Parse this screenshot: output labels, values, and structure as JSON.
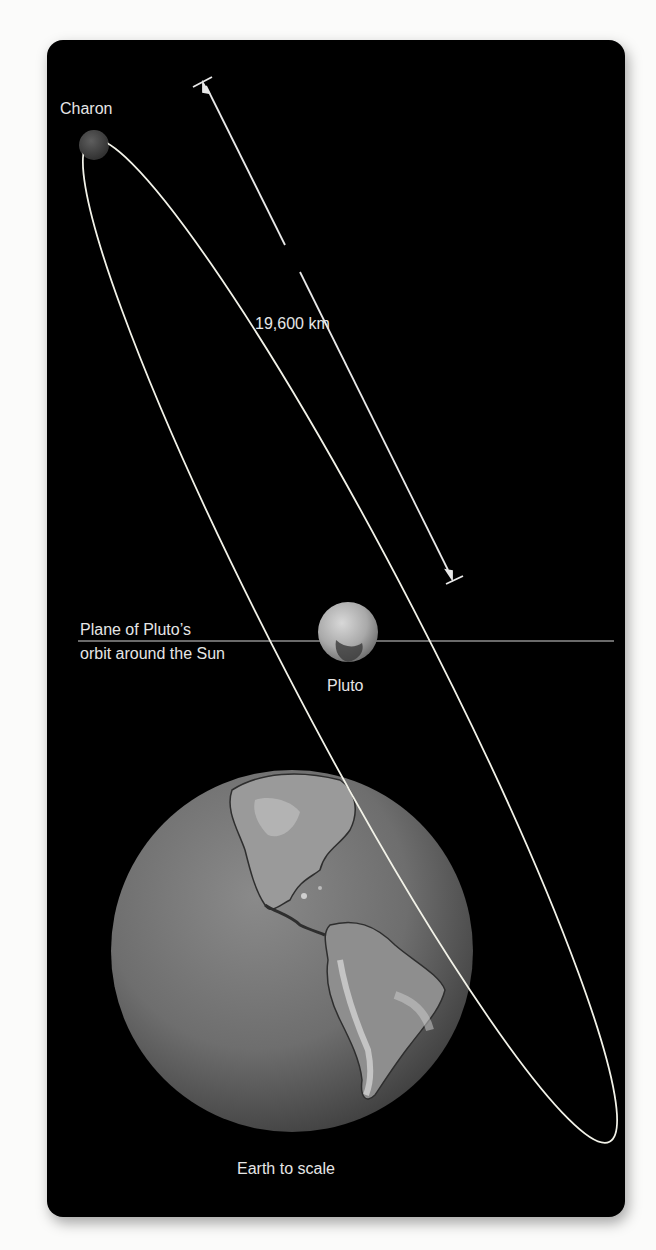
{
  "figure": {
    "background": "#000000",
    "labels": {
      "charon": "Charon",
      "distance": "19,600 km",
      "plane_line1": "Plane of Pluto’s",
      "plane_line2": "orbit around the Sun",
      "pluto": "Pluto",
      "earth": "Earth to scale"
    },
    "bodies": [
      {
        "name": "Charon",
        "role": "moon",
        "position": "top-left end of orbit"
      },
      {
        "name": "Pluto",
        "role": "central body",
        "position": "center of orbit"
      },
      {
        "name": "Earth",
        "role": "scale reference"
      }
    ],
    "measurement": {
      "label": "19,600 km",
      "description": "semi-major axis of Charon's orbit"
    },
    "colors": {
      "orbit": "#f2f2e8",
      "plane_line": "#9a9a9a",
      "text": "#e6e6e6"
    }
  }
}
